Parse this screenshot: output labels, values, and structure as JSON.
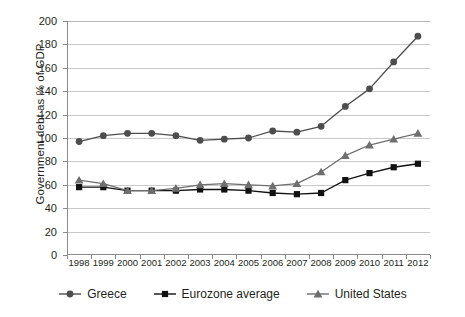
{
  "chart_data": {
    "type": "line",
    "title": "",
    "xlabel": "",
    "ylabel": "Government debt as % of GDP",
    "x": [
      "1998",
      "1999",
      "2000",
      "2001",
      "2002",
      "2003",
      "2004",
      "2005",
      "2006",
      "2007",
      "2008",
      "2009",
      "2010",
      "2011",
      "2012"
    ],
    "categories": [
      "1998",
      "1999",
      "2000",
      "2001",
      "2002",
      "2003",
      "2004",
      "2005",
      "2006",
      "2007",
      "2008",
      "2009",
      "2010",
      "2011",
      "2012"
    ],
    "ylim": [
      0,
      200
    ],
    "yticks": [
      0,
      20,
      40,
      60,
      80,
      100,
      120,
      140,
      160,
      180,
      200
    ],
    "ytick_labels": [
      "0",
      "20",
      "40",
      "60",
      "80",
      "100",
      "120",
      "140",
      "160",
      "180",
      "200"
    ],
    "grid": true,
    "legend_position": "bottom",
    "series": [
      {
        "name": "Greece",
        "marker": "circle",
        "color": "#4d4d4d",
        "values": [
          97,
          102,
          104,
          104,
          102,
          98,
          99,
          100,
          106,
          105,
          110,
          127,
          142,
          165,
          187
        ]
      },
      {
        "name": "Eurozone average",
        "marker": "square",
        "color": "#111111",
        "values": [
          58,
          58,
          55,
          55,
          55,
          56,
          56,
          55,
          53,
          52,
          53,
          64,
          70,
          75,
          78
        ]
      },
      {
        "name": "United States",
        "marker": "triangle",
        "color": "#6e6e6e",
        "values": [
          64,
          61,
          55,
          55,
          57,
          60,
          61,
          60,
          59,
          61,
          71,
          85,
          94,
          99,
          104
        ]
      }
    ]
  },
  "legend": {
    "items": [
      {
        "label": "Greece",
        "marker": "circle",
        "color": "#4d4d4d"
      },
      {
        "label": "Eurozone average",
        "marker": "square",
        "color": "#111111"
      },
      {
        "label": "United States",
        "marker": "triangle",
        "color": "#6e6e6e"
      }
    ]
  },
  "axis": {
    "y_title": "Government debt as % of GDP"
  }
}
